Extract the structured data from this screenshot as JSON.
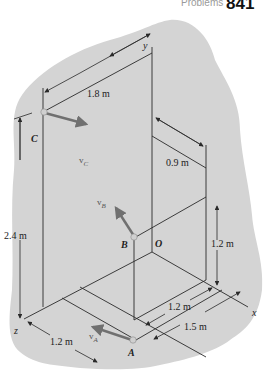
{
  "header": {
    "section": "Problems",
    "page_number": "841"
  },
  "axes": {
    "x": "x",
    "y": "y",
    "z": "z",
    "origin": "O"
  },
  "points": {
    "A": "A",
    "B": "B",
    "C": "C"
  },
  "velocities": {
    "vA": "v",
    "vA_sub": "A",
    "vB": "v",
    "vB_sub": "B",
    "vC": "v",
    "vC_sub": "C"
  },
  "dimensions": {
    "d_1_8": "1.8 m",
    "d_0_9": "0.9 m",
    "d_2_4": "2.4 m",
    "d_1_2_right": "1.2 m",
    "d_1_2_floor": "1.2 m",
    "d_1_5": "1.5 m",
    "d_1_2_z": "1.2 m"
  },
  "colors": {
    "blob": "#d4d4d4",
    "line": "#2a2a2a",
    "vector": "#707070",
    "point": "#c9c9c9"
  }
}
